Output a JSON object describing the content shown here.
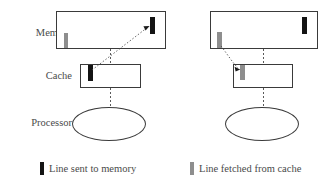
{
  "figure": {
    "background_color": "#ffffff",
    "text_color": "#4a4a4a",
    "stroke_color": "#3a3a3a",
    "black_line_color": "#141414",
    "gray_line_color": "#8e8e8e"
  },
  "row_labels": {
    "memory": "Memory",
    "cache": "Cache",
    "processor": "Processor"
  },
  "panels": [
    {
      "id": "left-panel",
      "name": "line-sent-to-memory-panel",
      "memory": {
        "name": "memory-box",
        "bars": [
          {
            "name": "memory-gray-line",
            "color": "gray",
            "position": "bottom-left"
          },
          {
            "name": "memory-black-line",
            "color": "black",
            "position": "top-right"
          }
        ]
      },
      "cache": {
        "name": "cache-box",
        "bars": [
          {
            "name": "cache-black-line",
            "color": "black",
            "position": "top-left"
          }
        ]
      },
      "processor": {
        "name": "processor-ellipse"
      },
      "arrow": {
        "name": "write-back-arrow",
        "from": "cache-black-line",
        "to": "memory-black-line",
        "style": "dotted",
        "direction": "up-right"
      },
      "connectors": [
        {
          "name": "memory-cache-connector",
          "style": "dashed"
        },
        {
          "name": "cache-processor-connector",
          "style": "dashed"
        }
      ]
    },
    {
      "id": "right-panel",
      "name": "line-fetched-from-cache-panel",
      "memory": {
        "name": "memory-box",
        "bars": [
          {
            "name": "memory-gray-line",
            "color": "gray",
            "position": "bottom-left"
          },
          {
            "name": "memory-black-line",
            "color": "black",
            "position": "top-right"
          }
        ]
      },
      "cache": {
        "name": "cache-box",
        "bars": [
          {
            "name": "cache-gray-line",
            "color": "gray",
            "position": "top-left"
          }
        ]
      },
      "processor": {
        "name": "processor-ellipse"
      },
      "arrow": {
        "name": "fetch-arrow",
        "from": "memory-gray-line",
        "to": "cache-gray-line",
        "style": "dotted",
        "direction": "down-left"
      },
      "connectors": [
        {
          "name": "memory-cache-connector",
          "style": "dashed"
        },
        {
          "name": "cache-processor-connector",
          "style": "dashed"
        }
      ]
    }
  ],
  "legend": [
    {
      "name": "legend-line-sent-to-memory",
      "swatch_color": "#141414",
      "label": "Line sent to memory"
    },
    {
      "name": "legend-line-fetched-from-cache",
      "swatch_color": "#8e8e8e",
      "label": "Line fetched from cache"
    }
  ]
}
